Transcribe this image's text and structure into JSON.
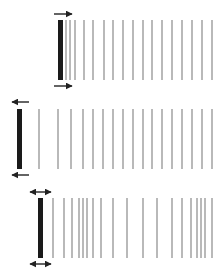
{
  "diagram": {
    "colors": {
      "piston": "#1a1a1a",
      "line": "#8a8a8a",
      "arrow": "#222222",
      "background": "#ffffff"
    },
    "panels": [
      {
        "name": "piston-moving-right",
        "arrow_direction": "right",
        "piston": {
          "x": 58,
          "y": 20,
          "w": 5,
          "h": 60
        },
        "arrows": [
          {
            "x1": 54,
            "x2": 72,
            "y": 14
          },
          {
            "x1": 54,
            "x2": 72,
            "y": 86
          }
        ],
        "line_y": [
          20,
          80
        ],
        "lines_x": [
          66,
          70,
          75,
          84,
          93,
          104,
          113,
          123,
          133,
          143,
          152,
          162,
          172,
          182,
          192,
          202,
          212
        ]
      },
      {
        "name": "piston-moving-left",
        "arrow_direction": "left",
        "piston": {
          "x": 17,
          "y": 109,
          "w": 5,
          "h": 60
        },
        "arrows": [
          {
            "x1": 12,
            "x2": 29,
            "y": 102
          },
          {
            "x1": 12,
            "x2": 29,
            "y": 175
          }
        ],
        "line_y": [
          109,
          169
        ],
        "lines_x": [
          39,
          58,
          71,
          83,
          93,
          103,
          113,
          123,
          133,
          143,
          152,
          162,
          172,
          182,
          192,
          202,
          212
        ]
      },
      {
        "name": "piston-oscillating",
        "arrow_direction": "both",
        "piston": {
          "x": 38,
          "y": 198,
          "w": 5,
          "h": 60
        },
        "arrows": [
          {
            "x1": 30,
            "x2": 51,
            "y": 192
          },
          {
            "x1": 30,
            "x2": 51,
            "y": 264
          }
        ],
        "line_y": [
          198,
          258
        ],
        "lines_x": [
          53,
          64,
          72,
          79,
          83,
          87,
          93,
          101,
          113,
          127,
          143,
          157,
          172,
          182,
          191,
          197,
          201,
          205,
          212
        ]
      }
    ]
  }
}
